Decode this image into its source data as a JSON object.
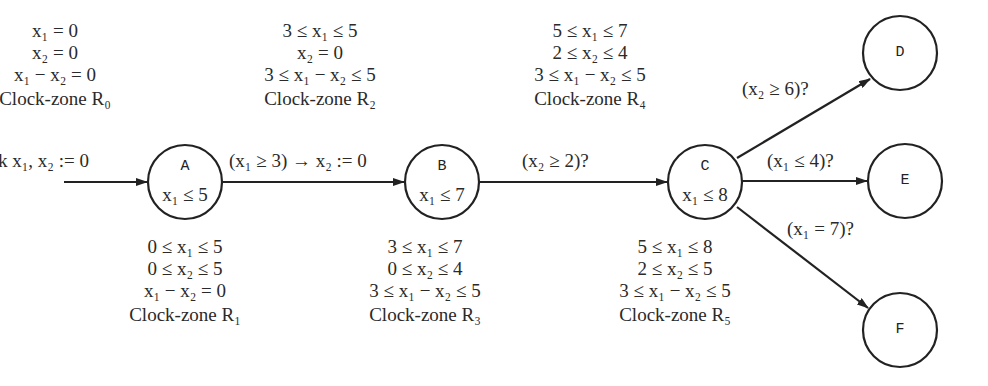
{
  "diagram": {
    "type": "timed-automaton",
    "colors": {
      "stroke": "#222222",
      "text": "#2a2a2a",
      "background": "#ffffff"
    },
    "initial_label": "k x₁, x₂ := 0",
    "nodes": [
      {
        "id": "A",
        "name": "A",
        "invariant": "x₁ ≤ 5"
      },
      {
        "id": "B",
        "name": "B",
        "invariant": "x₁ ≤ 7"
      },
      {
        "id": "C",
        "name": "C",
        "invariant": "x₁ ≤ 8"
      },
      {
        "id": "D",
        "name": "D",
        "invariant": ""
      },
      {
        "id": "E",
        "name": "E",
        "invariant": ""
      },
      {
        "id": "F",
        "name": "F",
        "invariant": ""
      }
    ],
    "edges": [
      {
        "from": "init",
        "to": "A",
        "label": "k x₁, x₂ := 0"
      },
      {
        "from": "A",
        "to": "B",
        "label": "(x₁ ≥ 3) → x₂ := 0"
      },
      {
        "from": "B",
        "to": "C",
        "label": "(x₂ ≥ 2)?"
      },
      {
        "from": "C",
        "to": "D",
        "label": "(x₂ ≥ 6)?"
      },
      {
        "from": "C",
        "to": "E",
        "label": "(x₁ ≤ 4)?"
      },
      {
        "from": "C",
        "to": "F",
        "label": "(x₁ = 7)?"
      }
    ],
    "zones": {
      "R0": {
        "lines": [
          "x₁ = 0",
          "x₂ = 0",
          "x₁ − x₂ = 0"
        ],
        "title": "Clock-zone R₀"
      },
      "R1": {
        "lines": [
          "0 ≤ x₁ ≤ 5",
          "0 ≤ x₂ ≤ 5",
          "x₁ − x₂ = 0"
        ],
        "title": "Clock-zone R₁"
      },
      "R2": {
        "lines": [
          "3 ≤ x₁ ≤ 5",
          "x₂ = 0",
          "3 ≤ x₁ − x₂ ≤ 5"
        ],
        "title": "Clock-zone R₂"
      },
      "R3": {
        "lines": [
          "3 ≤ x₁ ≤ 7",
          "0 ≤ x₂ ≤ 4",
          "3 ≤ x₁ − x₂ ≤ 5"
        ],
        "title": "Clock-zone R₃"
      },
      "R4": {
        "lines": [
          "5 ≤ x₁ ≤ 7",
          "2 ≤ x₂ ≤ 4",
          "3 ≤ x₁ − x₂ ≤ 5"
        ],
        "title": "Clock-zone R₄"
      },
      "R5": {
        "lines": [
          "5 ≤ x₁ ≤ 8",
          "2 ≤ x₂ ≤ 5",
          "3 ≤ x₁ − x₂ ≤ 5"
        ],
        "title": "Clock-zone R₅"
      }
    }
  }
}
